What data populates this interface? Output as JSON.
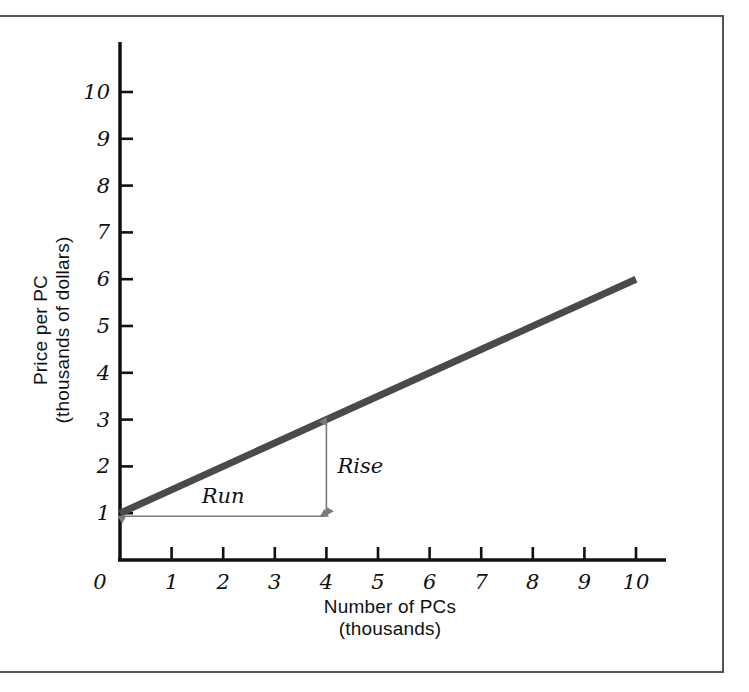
{
  "chart_data": {
    "type": "line",
    "title": "",
    "xlabel": "Number of PCs",
    "xlabel_sub": "(thousands)",
    "ylabel": "Price per PC",
    "ylabel_sub": "(thousands of dollars)",
    "xlim": [
      0,
      10
    ],
    "ylim": [
      0,
      10.6
    ],
    "xticks": [
      "0",
      "1",
      "2",
      "3",
      "4",
      "5",
      "6",
      "7",
      "8",
      "9",
      "10"
    ],
    "xtick_values": [
      0,
      1,
      2,
      3,
      4,
      5,
      6,
      7,
      8,
      9,
      10
    ],
    "yticks": [
      "1",
      "2",
      "3",
      "4",
      "5",
      "6",
      "7",
      "8",
      "9",
      "10"
    ],
    "ytick_values": [
      1,
      2,
      3,
      4,
      5,
      6,
      7,
      8,
      9,
      10
    ],
    "grid": false,
    "legend": "none",
    "series": [
      {
        "name": "supply",
        "x": [
          0,
          10
        ],
        "values": [
          1,
          6
        ],
        "color": "#4a4a4a",
        "width": 7,
        "slope": 0.5,
        "intercept": 1
      }
    ],
    "annotations": [
      {
        "label": "Rise",
        "type": "vertical-double-arrow",
        "x": 4,
        "y_from": 1,
        "y_to": 3,
        "magnitude": 2
      },
      {
        "label": "Run",
        "type": "horizontal-double-arrow",
        "y": 1,
        "x_from": 0,
        "x_to": 4,
        "magnitude": 4
      }
    ]
  },
  "figure": {
    "frame_color": "#50555a",
    "axis_color": "#111111",
    "background": "#ffffff"
  }
}
